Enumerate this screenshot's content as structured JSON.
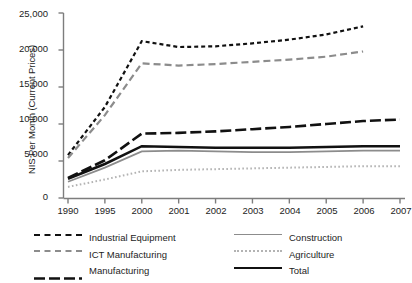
{
  "chart_data": {
    "type": "line",
    "title": "",
    "subtitle": "",
    "xlabel": "",
    "ylabel": "NIS Per Month (Current Prices)",
    "categories": [
      "1990",
      "1995",
      "2000",
      "2001",
      "2002",
      "2003",
      "2004",
      "2005",
      "2006",
      "2007"
    ],
    "ylim": [
      0,
      25000
    ],
    "yticks": [
      0,
      5000,
      10000,
      15000,
      20000,
      25000
    ],
    "ytick_labels": [
      "0",
      "5,000",
      "10,000",
      "15,000",
      "20,000",
      "25,000"
    ],
    "grid": false,
    "legend_position": "bottom",
    "series": [
      {
        "name": "Industrial Equipment",
        "style": "dashed",
        "color": "#111111",
        "values": [
          5800,
          12300,
          21200,
          20400,
          20500,
          20900,
          21400,
          22100,
          23200,
          null
        ]
      },
      {
        "name": "ICT Manufacturing",
        "style": "dashed-long",
        "color": "#8c8c8c",
        "values": [
          5400,
          11200,
          18200,
          17900,
          18100,
          18400,
          18700,
          19100,
          19800,
          null
        ]
      },
      {
        "name": "Manufacturing",
        "style": "dashed-xlong",
        "color": "#111111",
        "values": [
          2700,
          5100,
          8700,
          8800,
          9000,
          9300,
          9600,
          10000,
          10400,
          10600
        ]
      },
      {
        "name": "Construction",
        "style": "solid-thin",
        "color": "#8c8c8c",
        "values": [
          2200,
          4100,
          6300,
          6400,
          6300,
          6200,
          6200,
          6300,
          6400,
          6400
        ]
      },
      {
        "name": "Agriculture",
        "style": "dotted",
        "color": "#b3b3b3",
        "values": [
          1500,
          2500,
          3600,
          3800,
          3900,
          4000,
          4100,
          4200,
          4300,
          4300
        ]
      },
      {
        "name": "Total",
        "style": "solid-thick",
        "color": "#111111",
        "values": [
          2600,
          4600,
          7000,
          6900,
          6800,
          6800,
          6800,
          6900,
          7000,
          7000
        ]
      }
    ]
  },
  "axis": {
    "y_title": "NIS Per Month (Current Prices)",
    "y_tick_labels": [
      "25,000",
      "20,000",
      "15,000",
      "10,000",
      "5,000",
      "0"
    ],
    "x_tick_labels": [
      "1990",
      "1995",
      "2000",
      "2001",
      "2002",
      "2003",
      "2004",
      "2005",
      "2006",
      "2007"
    ]
  },
  "legend": {
    "items": [
      {
        "label": "Industrial Equipment",
        "column": "left"
      },
      {
        "label": "Construction",
        "column": "right"
      },
      {
        "label": "ICT Manufacturing",
        "column": "left"
      },
      {
        "label": "Agriculture",
        "column": "right"
      },
      {
        "label": "Manufacturing",
        "column": "left"
      },
      {
        "label": "Total",
        "column": "right"
      }
    ]
  }
}
